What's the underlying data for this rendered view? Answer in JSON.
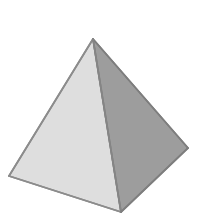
{
  "scene": {
    "name": "three-dimensional-pyramid",
    "width": 203,
    "height": 216,
    "background_color": "#ffffff",
    "description": "Shaded gray square-based pyramid rendered in three-quarter view on a plain white background"
  },
  "object": {
    "shape_name": "square-pyramid",
    "vertices": {
      "apex": [
        93,
        39
      ],
      "base_left": [
        9,
        176
      ],
      "base_front": [
        121,
        212
      ],
      "base_right": [
        188,
        148
      ]
    },
    "faces": [
      {
        "id": "left-face",
        "label": "Left front face",
        "points": "93,39 9,176 121,212",
        "fill": "#dedede",
        "stroke": "#8a8a8a",
        "stroke_width": 1.6
      },
      {
        "id": "right-face",
        "label": "Right front face",
        "points": "93,39 121,212 188,148",
        "fill": "#9d9d9d",
        "stroke": "#7d7d7d",
        "stroke_width": 1.6
      }
    ],
    "edges": [
      {
        "id": "edge-apex-left",
        "label": "Apex to base-left edge",
        "x1": 93,
        "y1": 39,
        "x2": 9,
        "y2": 176,
        "stroke": "#8c8c8c",
        "stroke_width": 1.8
      },
      {
        "id": "edge-apex-right",
        "label": "Apex to base-right edge",
        "x1": 93,
        "y1": 39,
        "x2": 188,
        "y2": 148,
        "stroke": "#7e7e7e",
        "stroke_width": 1.8
      },
      {
        "id": "edge-apex-front",
        "label": "Apex to base-front edge",
        "x1": 93,
        "y1": 39,
        "x2": 121,
        "y2": 212,
        "stroke": "#858585",
        "stroke_width": 1.8
      },
      {
        "id": "edge-left-front",
        "label": "Base-left to base-front edge",
        "x1": 9,
        "y1": 176,
        "x2": 121,
        "y2": 212,
        "stroke": "#8c8c8c",
        "stroke_width": 1.8
      },
      {
        "id": "edge-front-right",
        "label": "Base-front to base-right edge",
        "x1": 121,
        "y1": 212,
        "x2": 188,
        "y2": 148,
        "stroke": "#7e7e7e",
        "stroke_width": 1.8
      }
    ],
    "colors": {
      "left_face": "#dedede",
      "right_face": "#9d9d9d",
      "edge_stroke": "#848484",
      "background": "#ffffff"
    }
  }
}
